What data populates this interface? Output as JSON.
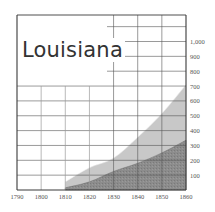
{
  "chart_data": {
    "type": "area",
    "title": "Louisiana",
    "xlabel": "",
    "ylabel": "",
    "x": [
      1810,
      1820,
      1830,
      1840,
      1850,
      1860
    ],
    "series": [
      {
        "name": "Total population (thousands)",
        "color": "#c8c8c8",
        "values": [
          55,
          150,
          215,
          355,
          515,
          708
        ]
      },
      {
        "name": "Subpopulation (thousands)",
        "color": "#8c8c8c",
        "values": [
          15,
          55,
          125,
          180,
          250,
          335
        ]
      }
    ],
    "x_ticks": [
      "1790",
      "1800",
      "1810",
      "1820",
      "1830",
      "1840",
      "1850",
      "1860"
    ],
    "y_ticks": [
      "100",
      "200",
      "300",
      "400",
      "500",
      "600",
      "700",
      "800",
      "900",
      "1,000"
    ],
    "xlim": [
      1790,
      1860
    ],
    "ylim": [
      0,
      1100
    ],
    "grid": true,
    "legend": "none",
    "stacked": false
  },
  "title": "Louisiana",
  "colors": {
    "frame": "#3a3a3a",
    "grid": "#555555",
    "light_fill": "#c8c8c8",
    "dark_fill": "#8c8c8c"
  }
}
